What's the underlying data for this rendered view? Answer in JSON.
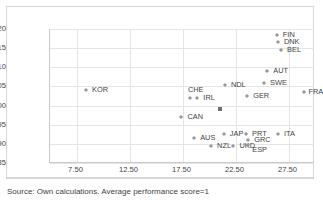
{
  "figure": {
    "source_note": "Source: Own calculations. Average performance score=1"
  },
  "chart_data": {
    "type": "scatter",
    "title": "",
    "xlabel": "",
    "ylabel": "",
    "xlim": [
      5.0,
      30.0
    ],
    "ylim": [
      0.85,
      1.2
    ],
    "grid": true,
    "legend": "none",
    "xticks": [
      "7.50",
      "12.50",
      "17.50",
      "22.50",
      "27.50"
    ],
    "xtick_values": [
      7.5,
      12.5,
      17.5,
      22.5,
      27.5
    ],
    "yticks": [
      "0.85",
      "0.90",
      "0.95",
      "1.00",
      "1.05",
      "1.10",
      "1.15",
      "1.20"
    ],
    "ytick_values": [
      0.85,
      0.9,
      0.95,
      1.0,
      1.05,
      1.1,
      1.15,
      1.2
    ],
    "points": [
      {
        "label": "KOR",
        "x": 8.4,
        "y": 1.04,
        "lx": 6,
        "ly": -4
      },
      {
        "label": "CHE",
        "x": 18.2,
        "y": 1.02,
        "lx": -2,
        "ly": -12
      },
      {
        "label": "IRL",
        "x": 18.9,
        "y": 1.02,
        "lx": 6,
        "ly": -4
      },
      {
        "label": "CAN",
        "x": 17.4,
        "y": 0.97,
        "lx": 6,
        "ly": -4
      },
      {
        "label": "AUS",
        "x": 18.6,
        "y": 0.915,
        "lx": 6,
        "ly": -4
      },
      {
        "label": "NZL",
        "x": 20.2,
        "y": 0.895,
        "lx": 6,
        "ly": -4
      },
      {
        "label": "JAP",
        "x": 21.4,
        "y": 0.925,
        "lx": 6,
        "ly": -4
      },
      {
        "label": "UKD",
        "x": 22.3,
        "y": 0.895,
        "lx": 6,
        "ly": -4
      },
      {
        "label": "NDL",
        "x": 21.5,
        "y": 1.055,
        "lx": 6,
        "ly": -4
      },
      {
        "label": "GER",
        "x": 23.6,
        "y": 1.025,
        "lx": 6,
        "ly": -4
      },
      {
        "label": "PRT",
        "x": 23.5,
        "y": 0.925,
        "lx": 6,
        "ly": -4
      },
      {
        "label": "GRC",
        "x": 23.7,
        "y": 0.91,
        "lx": 6,
        "ly": -4
      },
      {
        "label": "ESP",
        "x": 23.7,
        "y": 0.898,
        "lx": 4,
        "ly": 1
      },
      {
        "label": "SWE",
        "x": 25.2,
        "y": 1.06,
        "lx": 6,
        "ly": -4
      },
      {
        "label": "AUT",
        "x": 25.5,
        "y": 1.09,
        "lx": 6,
        "ly": -4
      },
      {
        "label": "FIN",
        "x": 26.4,
        "y": 1.185,
        "lx": 6,
        "ly": -4
      },
      {
        "label": "DNK",
        "x": 26.5,
        "y": 1.165,
        "lx": 6,
        "ly": -4
      },
      {
        "label": "BEL",
        "x": 26.8,
        "y": 1.145,
        "lx": 6,
        "ly": -4
      },
      {
        "label": "ITA",
        "x": 26.5,
        "y": 0.925,
        "lx": 6,
        "ly": -4
      },
      {
        "label": "FRA",
        "x": 29.0,
        "y": 1.035,
        "lx": 4,
        "ly": -4
      },
      {
        "label": "",
        "x": 21.0,
        "y": 0.99,
        "lx": 0,
        "ly": 0,
        "marker": "dark"
      }
    ]
  }
}
